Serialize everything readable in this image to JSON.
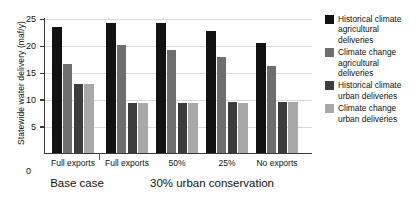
{
  "chart_data": {
    "type": "bar",
    "title": "",
    "xlabel": "",
    "ylabel": "Statewide water delivery (maf/y)",
    "ylim": [
      0,
      25
    ],
    "yticks": [
      0,
      5,
      10,
      15,
      20,
      25
    ],
    "grid": true,
    "legend_position": "right",
    "categories": [
      "Full exports",
      "Full exports",
      "50%",
      "25%",
      "No exports"
    ],
    "supergroups": [
      {
        "label": "Base case",
        "categories": [
          "Full exports"
        ]
      },
      {
        "label": "30% urban conservation",
        "categories": [
          "Full exports",
          "50%",
          "25%",
          "No exports"
        ]
      }
    ],
    "series": [
      {
        "name": "Historical climate agricultural deliveries",
        "color": "#121212",
        "values": [
          23.3,
          24.0,
          24.0,
          22.6,
          20.3
        ]
      },
      {
        "name": "Climate change agricultural deliveries",
        "color": "#6e6e6e",
        "values": [
          16.5,
          19.9,
          19.0,
          17.8,
          16.1
        ]
      },
      {
        "name": "Historical climate urban deliveries",
        "color": "#3c3c3c",
        "values": [
          12.8,
          9.3,
          9.3,
          9.4,
          9.4
        ]
      },
      {
        "name": "Climate change urban deliveries",
        "color": "#a8a8a8",
        "values": [
          12.7,
          9.3,
          9.3,
          9.3,
          9.4
        ]
      }
    ]
  },
  "axis": {
    "y_title": "Statewide water delivery (maf/y)",
    "tick_25": "25",
    "tick_20": "20",
    "tick_15": "15",
    "tick_10": "10",
    "tick_5": "5",
    "tick_0": "0"
  },
  "categories": {
    "c0": "Full exports",
    "c1": "Full exports",
    "c2": "50%",
    "c3": "25%",
    "c4": "No exports"
  },
  "groups": {
    "g0": "Base case",
    "g1": "30% urban conservation"
  },
  "legend": {
    "items": [
      {
        "label": "Historical climate agricultural deliveries",
        "color": "#121212"
      },
      {
        "label": "Climate change agricultural deliveries",
        "color": "#6e6e6e"
      },
      {
        "label": "Historical climate urban deliveries",
        "color": "#3c3c3c"
      },
      {
        "label": "Climate change urban deliveries",
        "color": "#a8a8a8"
      }
    ],
    "item0": "Historical climate agricultural deliveries",
    "item1": "Climate change agricultural deliveries",
    "item2": "Historical climate urban deliveries",
    "item3": "Climate change urban deliveries"
  }
}
